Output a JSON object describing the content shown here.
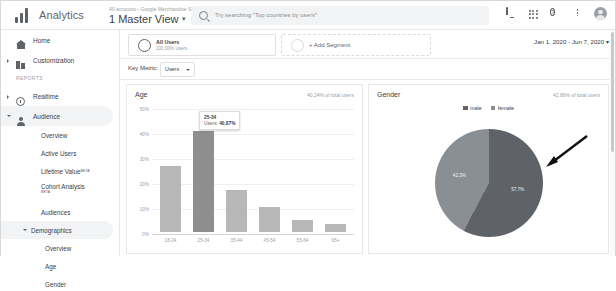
{
  "topbar": {
    "brand": "Analytics",
    "breadcrumb": "All accounts › Google Merchandise St...",
    "view_selector": "1 Master View",
    "caret": "▾",
    "search_placeholder": "Try searching \"Top countries by users\"",
    "icons": [
      "notifications-bell",
      "apps-grid",
      "help",
      "more-options",
      "account-avatar"
    ],
    "help_glyph": "?"
  },
  "sidebar": {
    "items": [
      {
        "label": "Home",
        "icon": "home-icon",
        "expandable": false,
        "selected": false
      },
      {
        "label": "Customization",
        "icon": "customization-icon",
        "expandable": true,
        "selected": false
      }
    ],
    "section_label": "REPORTS",
    "reports": [
      {
        "label": "Realtime",
        "icon": "clock-icon",
        "expandable": true,
        "selected": false
      },
      {
        "label": "Audience",
        "icon": "person-icon",
        "expandable": true,
        "selected": true
      }
    ],
    "audience_children": [
      {
        "label": "Overview",
        "badge": ""
      },
      {
        "label": "Active Users",
        "badge": ""
      },
      {
        "label": "Lifetime Value",
        "badge": "BETA"
      },
      {
        "label": "Cohort Analysis",
        "badge": "BETA"
      },
      {
        "label": "Audiences",
        "badge": ""
      }
    ],
    "demographics": {
      "label": "Demographics",
      "children": [
        {
          "label": "Overview"
        },
        {
          "label": "Age"
        },
        {
          "label": "Gender"
        }
      ]
    }
  },
  "segments": {
    "all_users": {
      "title": "All Users",
      "subtitle": "100.00% Users"
    },
    "add_segment": "+ Add Segment",
    "date_range": "Jan 1, 2020 - Jun 7, 2020",
    "date_caret": "▾"
  },
  "key_metric": {
    "label": "Key Metric:",
    "value": "Users"
  },
  "panels": {
    "age": {
      "title": "Age",
      "subtitle": "40.24% of total users",
      "tooltip": {
        "category": "25-34",
        "metric_label": "Users:",
        "metric_value": "40.87%"
      }
    },
    "gender": {
      "title": "Gender",
      "subtitle": "42.86% of total users"
    }
  },
  "chart_data": [
    {
      "type": "bar",
      "title": "Age",
      "categories": [
        "18-24",
        "25-34",
        "35-44",
        "45-54",
        "55-64",
        "65+"
      ],
      "values": [
        27.0,
        40.87,
        17.0,
        10.2,
        5.0,
        3.1
      ],
      "highlight_index": 1,
      "ytick_labels": [
        "50%",
        "40%",
        "30%",
        "20%",
        "10%",
        "0%"
      ],
      "yticks": [
        50,
        40,
        30,
        20,
        10,
        0
      ],
      "ylim": [
        0,
        50
      ],
      "xlabel": "",
      "ylabel": "",
      "grid": true,
      "legend": "none",
      "bar_color": "#b7b7b7",
      "highlight_color": "#8e8e8e"
    },
    {
      "type": "pie",
      "title": "Gender",
      "labels": [
        "male",
        "female"
      ],
      "values": [
        57.7,
        42.3
      ],
      "value_labels": [
        "57.7%",
        "42.3%"
      ],
      "colors": [
        "#5f6368",
        "#8a8f94"
      ],
      "legend": "top",
      "annotation": "arrow-pointing-to-male-slice"
    }
  ],
  "colors": {
    "bar": "#b7b7b7",
    "bar_highlight": "#8e8e8e",
    "pie_male": "#5f6368",
    "pie_female": "#8a8f94",
    "text_primary": "#3c4043",
    "text_muted": "#9aa0a6",
    "selected_nav": "#f1f3f4"
  }
}
